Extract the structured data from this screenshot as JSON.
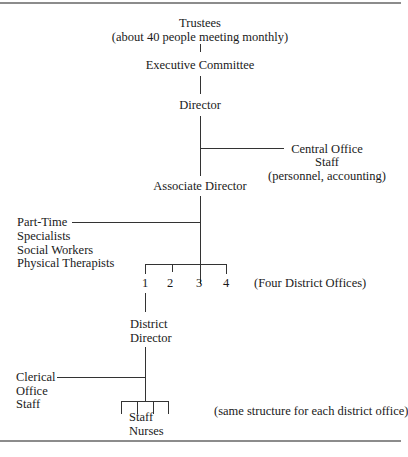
{
  "diagram": {
    "type": "organizational-chart",
    "nodes": {
      "trustees": {
        "title": "Trustees",
        "note": "(about 40 people meeting monthly)"
      },
      "executive_committee": {
        "title": "Executive Committee"
      },
      "director": {
        "title": "Director"
      },
      "central_office": {
        "line1": "Central Office",
        "line2": "Staff",
        "line3": "(personnel, accounting)"
      },
      "associate_director": {
        "title": "Associate Director"
      },
      "part_time": {
        "line1": "Part-Time",
        "line2": "Specialists",
        "line3": "Social Workers",
        "line4": "Physical Therapists"
      },
      "district_offices": {
        "numbers": [
          "1",
          "2",
          "3",
          "4"
        ],
        "note": "(Four District Offices)"
      },
      "district_director": {
        "line1": "District",
        "line2": "Director"
      },
      "clerical": {
        "line1": "Clerical",
        "line2": "Office",
        "line3": "Staff"
      },
      "staff_nurses": {
        "line1": "Staff",
        "line2": "Nurses",
        "note": "(same structure for each district office)"
      }
    },
    "edges": [
      [
        "Trustees",
        "Executive Committee"
      ],
      [
        "Executive Committee",
        "Director"
      ],
      [
        "Director",
        "Central Office Staff"
      ],
      [
        "Director",
        "Associate Director"
      ],
      [
        "Associate Director",
        "Part-Time Specialists"
      ],
      [
        "Associate Director",
        "District Offices 1-4"
      ],
      [
        "District Office 1",
        "District Director"
      ],
      [
        "District Director",
        "Clerical Office Staff"
      ],
      [
        "District Director",
        "Staff Nurses"
      ]
    ]
  }
}
